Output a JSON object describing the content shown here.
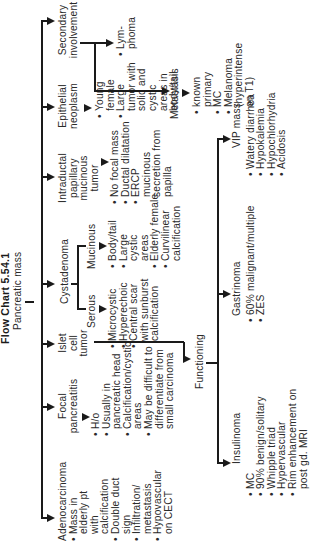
{
  "title": "Flow Chart 5.54.1",
  "root": "Pancreatic mass",
  "branches": {
    "adenocarcinoma": {
      "label": "Adenocarcinoma",
      "bullets": [
        "Mass in elderly pt with calcification",
        "Double duct sign",
        "Infiltration/ metastasis",
        "Hypovascular on CECT"
      ]
    },
    "focal_pancreatitis": {
      "label": "Focal pancreatitis",
      "bullets": [
        "H/o",
        "Usually in pancreatic head",
        "Calcification/cystic areas",
        "May be difficult to differentiate from small carcinoma"
      ]
    },
    "islet_cell_tumor": {
      "label": "Islet cell tumor",
      "functioning": {
        "label": "Functioning",
        "insulinoma": {
          "label": "Insulinoma",
          "bullets": [
            "MC",
            "90% benign/solitary",
            "Whipple triad",
            "Hypervascular",
            "Rim enhancement on post gd. MRI"
          ]
        },
        "gastrinoma": {
          "label": "Gastrinoma",
          "bullets": [
            "60% malignant/multiple",
            "ZES"
          ]
        },
        "vip_mass": {
          "label": "VIP mass",
          "bullets": [
            "Watery diarrhea",
            "Hypokalemia",
            "Hypochlorhydria",
            "Acidosis"
          ]
        }
      }
    },
    "cystadenoma": {
      "label": "Cystadenoma",
      "serous": {
        "label": "Serous",
        "bullets": [
          "Microcystic",
          "Hyperechoic",
          "Central scar with sunburst calcification"
        ]
      },
      "mucinous": {
        "label": "Mucinous",
        "bullets": [
          "Body/tail",
          "Large cystic areas",
          "Elderly female",
          "Curvilinear calcification"
        ]
      }
    },
    "ipmt": {
      "label": "Intraductal papillary mucinous tumor",
      "bullets": [
        "No focal mass",
        "Ductal dilatation",
        "ERCP mucinous secretion from papilla"
      ]
    },
    "epithelial_neoplasm": {
      "label": "Epithelial neoplasm",
      "bullets": [
        "Young female",
        "Large tumor with solid and cystic areas in body/tail"
      ]
    },
    "secondary": {
      "label": "Secondary involvement",
      "lymphoma": "Lym-phoma",
      "metastasis": {
        "label": "Metastasis",
        "bullets": [
          "known primary",
          "MC",
          "Melanoma (hyperintense on T1)"
        ]
      }
    }
  }
}
